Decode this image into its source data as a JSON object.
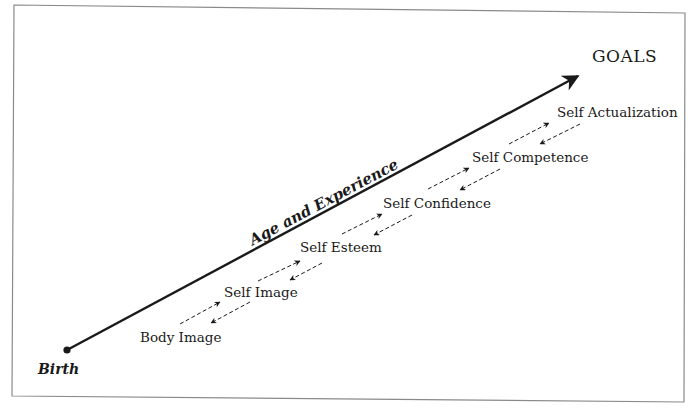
{
  "diagram": {
    "goal_label": "GOALS",
    "start_label": "Birth",
    "axis_label": "Age and Experience",
    "stages": [
      {
        "label": "Body Image"
      },
      {
        "label": "Self Image"
      },
      {
        "label": "Self Esteem"
      },
      {
        "label": "Self Confidence"
      },
      {
        "label": "Self Competence"
      },
      {
        "label": "Self Actualization"
      }
    ],
    "colors": {
      "line": "#1a1a1a",
      "border": "#8a8a8a",
      "background": "#ffffff"
    }
  }
}
